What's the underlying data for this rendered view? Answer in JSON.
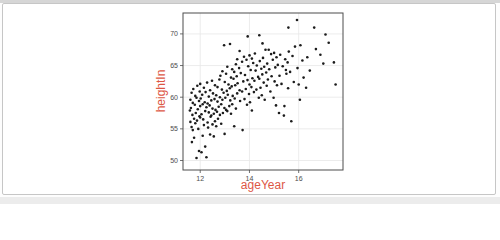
{
  "figure": {
    "card_border_color": "#c6c6c6",
    "background_color": "#ffffff"
  },
  "chart_data": {
    "type": "scatter",
    "title": "",
    "xlabel": "ageYear",
    "ylabel": "heightIn",
    "x_ticks": [
      12,
      14,
      16
    ],
    "y_ticks": [
      50,
      55,
      60,
      65,
      70
    ],
    "x_range": [
      11.3,
      17.8
    ],
    "y_range": [
      48.5,
      73.3
    ],
    "grid": "on",
    "legend": "none",
    "point_color": "#1c1c1c",
    "axis_title_color": "#dd5745",
    "tick_label_color": "#4d4d4d",
    "grid_color": "#e7e7e7",
    "panel_border_color": "#4d4d4d",
    "points": [
      [
        11.58,
        57.9
      ],
      [
        11.6,
        59.6
      ],
      [
        11.6,
        56.1
      ],
      [
        11.62,
        58.3
      ],
      [
        11.65,
        60.7
      ],
      [
        11.65,
        55.3
      ],
      [
        11.66,
        52.9
      ],
      [
        11.68,
        57.2
      ],
      [
        11.7,
        59.1
      ],
      [
        11.7,
        54.8
      ],
      [
        11.72,
        61.3
      ],
      [
        11.75,
        56.6
      ],
      [
        11.75,
        53.6
      ],
      [
        11.78,
        58.8
      ],
      [
        11.8,
        60.2
      ],
      [
        11.8,
        55.9
      ],
      [
        11.82,
        57.5
      ],
      [
        11.85,
        50.4
      ],
      [
        11.85,
        59.9
      ],
      [
        11.87,
        56.3
      ],
      [
        11.88,
        61.8
      ],
      [
        11.9,
        58.1
      ],
      [
        11.92,
        55.0
      ],
      [
        11.95,
        51.5
      ],
      [
        11.95,
        59.4
      ],
      [
        11.97,
        57.0
      ],
      [
        11.98,
        60.9
      ],
      [
        12.0,
        56.8
      ],
      [
        12.0,
        58.6
      ],
      [
        12.0,
        62.1
      ],
      [
        12.02,
        59.8
      ],
      [
        12.05,
        51.3
      ],
      [
        12.05,
        57.3
      ],
      [
        12.08,
        60.4
      ],
      [
        12.1,
        53.9
      ],
      [
        12.1,
        58.9
      ],
      [
        12.12,
        56.5
      ],
      [
        12.15,
        61.5
      ],
      [
        12.15,
        55.6
      ],
      [
        12.18,
        59.2
      ],
      [
        12.2,
        52.2
      ],
      [
        12.2,
        57.8
      ],
      [
        12.22,
        60.8
      ],
      [
        12.25,
        50.5
      ],
      [
        12.25,
        58.4
      ],
      [
        12.28,
        62.3
      ],
      [
        12.3,
        56.0
      ],
      [
        12.3,
        59.0
      ],
      [
        12.32,
        55.2
      ],
      [
        12.35,
        57.6
      ],
      [
        12.35,
        60.1
      ],
      [
        12.38,
        58.7
      ],
      [
        12.4,
        54.1
      ],
      [
        12.4,
        61.1
      ],
      [
        12.42,
        56.9
      ],
      [
        12.45,
        59.5
      ],
      [
        12.45,
        57.1
      ],
      [
        12.48,
        62.6
      ],
      [
        12.5,
        55.7
      ],
      [
        12.5,
        58.2
      ],
      [
        12.52,
        60.6
      ],
      [
        12.55,
        53.8
      ],
      [
        12.55,
        57.4
      ],
      [
        12.58,
        59.7
      ],
      [
        12.6,
        56.2
      ],
      [
        12.6,
        61.9
      ],
      [
        12.62,
        58.0
      ],
      [
        12.65,
        60.3
      ],
      [
        12.65,
        55.4
      ],
      [
        12.68,
        57.7
      ],
      [
        12.7,
        59.3
      ],
      [
        12.7,
        61.6
      ],
      [
        12.72,
        56.6
      ],
      [
        12.75,
        58.5
      ],
      [
        12.78,
        62.8
      ],
      [
        12.8,
        57.2
      ],
      [
        12.8,
        60.0
      ],
      [
        12.82,
        63.4
      ],
      [
        12.85,
        58.9
      ],
      [
        12.85,
        55.8
      ],
      [
        12.88,
        61.2
      ],
      [
        12.9,
        59.6
      ],
      [
        12.9,
        64.1
      ],
      [
        12.92,
        57.5
      ],
      [
        12.95,
        60.7
      ],
      [
        12.97,
        68.2
      ],
      [
        12.98,
        58.3
      ],
      [
        12.99,
        54.2
      ],
      [
        13.0,
        62.4
      ],
      [
        13.02,
        59.9
      ],
      [
        13.05,
        63.7
      ],
      [
        13.05,
        58.0
      ],
      [
        13.08,
        61.0
      ],
      [
        13.1,
        64.8
      ],
      [
        13.1,
        57.8
      ],
      [
        13.12,
        60.4
      ],
      [
        13.15,
        62.0
      ],
      [
        13.18,
        58.6
      ],
      [
        13.21,
        68.4
      ],
      [
        13.2,
        61.4
      ],
      [
        13.22,
        59.5
      ],
      [
        13.25,
        63.1
      ],
      [
        13.25,
        57.4
      ],
      [
        13.28,
        61.7
      ],
      [
        13.3,
        64.4
      ],
      [
        13.3,
        58.9
      ],
      [
        13.32,
        60.2
      ],
      [
        13.35,
        62.9
      ],
      [
        13.38,
        55.4
      ],
      [
        13.38,
        64.0
      ],
      [
        13.4,
        59.8
      ],
      [
        13.42,
        61.9
      ],
      [
        13.45,
        65.2
      ],
      [
        13.45,
        58.2
      ],
      [
        13.48,
        63.3
      ],
      [
        13.5,
        60.6
      ],
      [
        13.5,
        66.0
      ],
      [
        13.52,
        62.2
      ],
      [
        13.72,
        54.8
      ],
      [
        13.58,
        64.6
      ],
      [
        13.6,
        61.1
      ],
      [
        13.6,
        67.3
      ],
      [
        13.62,
        59.4
      ],
      [
        13.65,
        63.8
      ],
      [
        13.7,
        65.6
      ],
      [
        13.7,
        60.9
      ],
      [
        13.75,
        62.5
      ],
      [
        13.78,
        66.4
      ],
      [
        13.8,
        59.7
      ],
      [
        13.82,
        63.5
      ],
      [
        13.85,
        61.3
      ],
      [
        13.88,
        65.9
      ],
      [
        13.93,
        69.6
      ],
      [
        13.9,
        58.8
      ],
      [
        13.92,
        62.7
      ],
      [
        13.95,
        64.9
      ],
      [
        13.98,
        60.5
      ],
      [
        14.0,
        66.6
      ],
      [
        14.0,
        62.0
      ],
      [
        14.02,
        59.2
      ],
      [
        14.05,
        64.3
      ],
      [
        14.08,
        61.6
      ],
      [
        14.1,
        66.1
      ],
      [
        14.1,
        57.9
      ],
      [
        14.12,
        63.0
      ],
      [
        14.15,
        65.4
      ],
      [
        14.18,
        60.8
      ],
      [
        14.2,
        62.6
      ],
      [
        14.22,
        66.9
      ],
      [
        14.25,
        64.2
      ],
      [
        14.28,
        61.2
      ],
      [
        14.3,
        65.0
      ],
      [
        14.35,
        63.2
      ],
      [
        14.38,
        59.9
      ],
      [
        14.4,
        69.8
      ],
      [
        14.4,
        62.9
      ],
      [
        14.42,
        65.7
      ],
      [
        14.45,
        61.5
      ],
      [
        14.48,
        64.5
      ],
      [
        14.53,
        68.5
      ],
      [
        14.5,
        60.3
      ],
      [
        14.52,
        63.6
      ],
      [
        14.55,
        66.2
      ],
      [
        14.58,
        62.3
      ],
      [
        14.6,
        64.8
      ],
      [
        14.62,
        59.6
      ],
      [
        14.65,
        67.5
      ],
      [
        14.68,
        63.9
      ],
      [
        14.7,
        61.8
      ],
      [
        14.72,
        65.3
      ],
      [
        14.75,
        62.8
      ],
      [
        14.78,
        67.5
      ],
      [
        14.8,
        64.4
      ],
      [
        14.85,
        60.9
      ],
      [
        14.88,
        66.8
      ],
      [
        14.9,
        63.3
      ],
      [
        14.95,
        65.9
      ],
      [
        14.98,
        59.9
      ],
      [
        15.0,
        67.0
      ],
      [
        15.02,
        62.5
      ],
      [
        15.05,
        64.7
      ],
      [
        15.08,
        58.7
      ],
      [
        15.1,
        66.3
      ],
      [
        15.12,
        61.9
      ],
      [
        15.15,
        65.1
      ],
      [
        15.58,
        71.0
      ],
      [
        15.2,
        57.5
      ],
      [
        15.22,
        63.4
      ],
      [
        15.25,
        66.7
      ],
      [
        15.3,
        62.1
      ],
      [
        15.35,
        64.9
      ],
      [
        15.4,
        57.1
      ],
      [
        15.42,
        58.6
      ],
      [
        15.45,
        66.0
      ],
      [
        15.48,
        64.3
      ],
      [
        15.5,
        63.7
      ],
      [
        15.55,
        65.5
      ],
      [
        15.57,
        61.4
      ],
      [
        15.6,
        67.2
      ],
      [
        15.65,
        64.0
      ],
      [
        15.7,
        56.2
      ],
      [
        15.75,
        66.5
      ],
      [
        15.8,
        62.4
      ],
      [
        15.85,
        68.0
      ],
      [
        15.93,
        72.2
      ],
      [
        15.95,
        64.6
      ],
      [
        16.0,
        62.0
      ],
      [
        16.05,
        59.6
      ],
      [
        16.07,
        68.2
      ],
      [
        16.15,
        65.8
      ],
      [
        16.2,
        63.1
      ],
      [
        16.3,
        61.5
      ],
      [
        16.35,
        66.3
      ],
      [
        16.45,
        64.2
      ],
      [
        16.63,
        71.0
      ],
      [
        16.7,
        67.6
      ],
      [
        16.88,
        66.7
      ],
      [
        17.0,
        65.3
      ],
      [
        17.09,
        69.9
      ],
      [
        17.22,
        68.6
      ],
      [
        17.43,
        65.5
      ],
      [
        17.5,
        62.0
      ]
    ]
  }
}
